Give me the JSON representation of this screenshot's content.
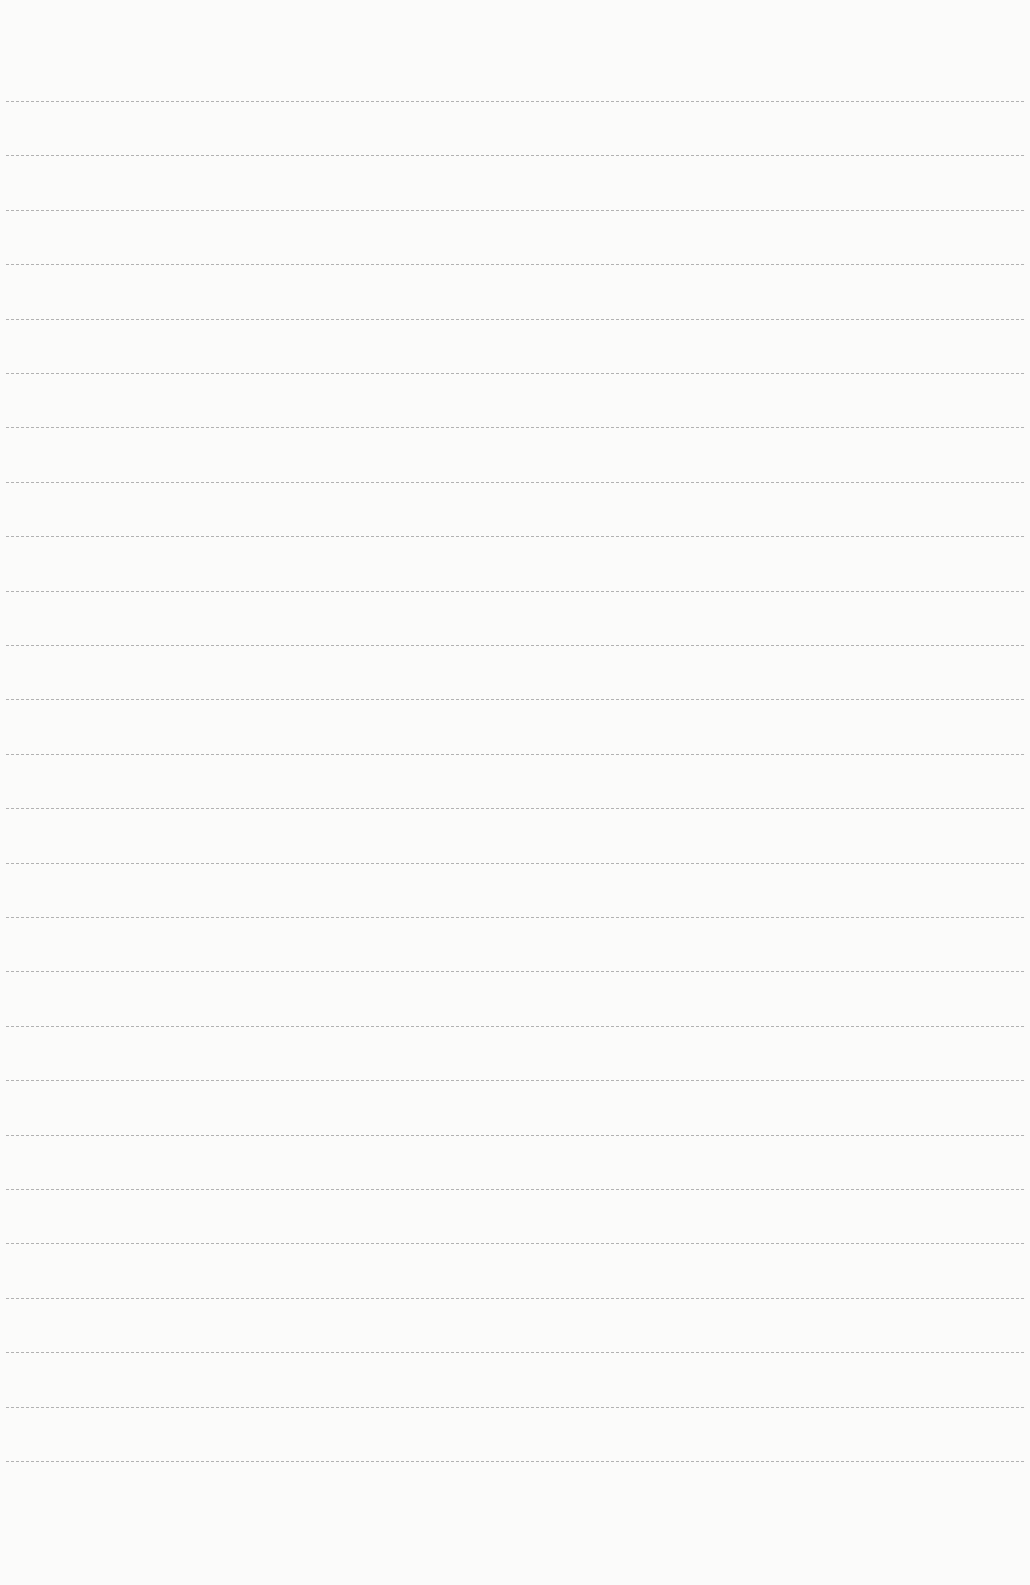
{
  "page": {
    "type": "blank lined paper",
    "background_color": "#fbfbfa",
    "line_color": "#9a9a9a",
    "line_count": 26,
    "first_line_y": 101,
    "line_spacing": 54.4
  }
}
